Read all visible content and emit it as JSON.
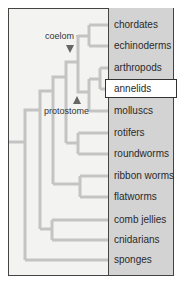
{
  "diagram": {
    "type": "phylogenetic-tree",
    "taxa": [
      {
        "label": "chordates",
        "y": 25
      },
      {
        "label": "echinoderms",
        "y": 46
      },
      {
        "label": "arthropods",
        "y": 68
      },
      {
        "label": "annelids",
        "y": 89,
        "highlighted": true
      },
      {
        "label": "molluscs",
        "y": 111
      },
      {
        "label": "rotifers",
        "y": 133
      },
      {
        "label": "roundworms",
        "y": 154
      },
      {
        "label": "ribbon worms",
        "y": 176
      },
      {
        "label": "flatworms",
        "y": 197
      },
      {
        "label": "comb jellies",
        "y": 220
      },
      {
        "label": "cnidarians",
        "y": 240
      },
      {
        "label": "sponges",
        "y": 260
      }
    ],
    "annotations": {
      "coelom": "coelom",
      "protostome": "protostome"
    },
    "colors": {
      "branch": "#c4c4c4",
      "panel": "#d3d3d3",
      "background": "#f3f3f1",
      "marker": "#666666",
      "highlight_bg": "#ffffff"
    }
  }
}
